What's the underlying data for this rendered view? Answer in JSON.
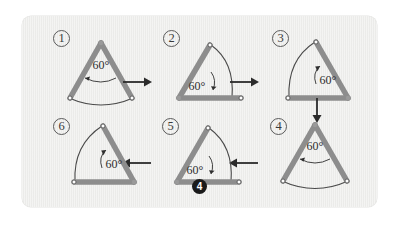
{
  "figure": {
    "number_label": "4",
    "background_color": "#eeeeec",
    "page_color": "#ffffff",
    "compass_leg_color": "#8d8d8d",
    "arc_color": "#4a4a4a",
    "text_color": "#333333",
    "angle_text": "60°"
  },
  "steps": [
    {
      "id": "step-1",
      "label": "1",
      "angle_text": "60°",
      "description": "compass apex up, arc drawn at bottom"
    },
    {
      "id": "step-2",
      "label": "2",
      "angle_text": "60°",
      "description": "compass pivoted, arc drawn on the right"
    },
    {
      "id": "step-3",
      "label": "3",
      "angle_text": "60°",
      "description": "compass pivoted, arc drawn on the left"
    },
    {
      "id": "step-4",
      "label": "4",
      "angle_text": "60°",
      "description": "compass apex up, arc drawn at bottom"
    },
    {
      "id": "step-5",
      "label": "5",
      "angle_text": "60°",
      "description": "compass pivoted, arc drawn on the right"
    },
    {
      "id": "step-6",
      "label": "6",
      "angle_text": "60°",
      "description": "compass pivoted, arc drawn on the left"
    }
  ],
  "arrows": [
    {
      "id": "arrow-1-to-2",
      "direction": "right"
    },
    {
      "id": "arrow-2-to-3",
      "direction": "right"
    },
    {
      "id": "arrow-3-to-4",
      "direction": "down"
    },
    {
      "id": "arrow-4-to-5",
      "direction": "left"
    },
    {
      "id": "arrow-5-to-6",
      "direction": "left"
    }
  ]
}
